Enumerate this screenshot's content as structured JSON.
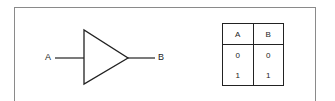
{
  "diagram": {
    "type": "buffer-gate",
    "input_label": "A",
    "output_label": "B",
    "stroke_color": "#222222",
    "frame_color": "#8a8a8a"
  },
  "truth_table": {
    "headers": [
      "A",
      "B"
    ],
    "rows": [
      [
        "0",
        "0"
      ],
      [
        "1",
        "1"
      ]
    ]
  }
}
